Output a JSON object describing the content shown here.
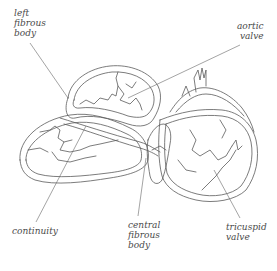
{
  "figure": {
    "type": "anatomical line drawing",
    "line_color": "#555555",
    "label_color": "#4a4a4a",
    "background": "#ffffff"
  },
  "labels": {
    "left_fibrous_body": {
      "lines": [
        "left",
        "fibrous",
        "body"
      ]
    },
    "aortic_valve": {
      "lines": [
        "aortic",
        "valve"
      ]
    },
    "continuity": {
      "lines": [
        "continuity"
      ]
    },
    "central_fibrous_body": {
      "lines": [
        "central",
        "fibrous",
        "body"
      ]
    },
    "tricuspid_valve": {
      "lines": [
        "tricuspid",
        "valve"
      ]
    }
  }
}
